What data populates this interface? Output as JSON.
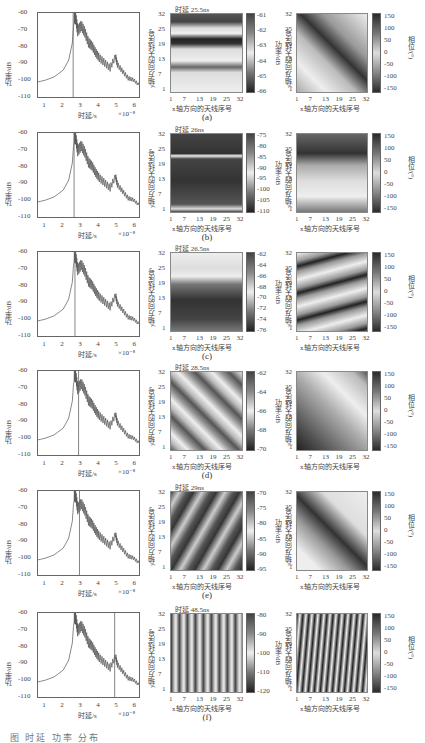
{
  "figure": {
    "caption_partial": "图  时延 功率 分布"
  },
  "common": {
    "left_ylabel": "功率/dB",
    "left_xlabel": "时延/s",
    "left_xmult": "×10⁻⁸",
    "left_yticks": [
      "-60",
      "-70",
      "-80",
      "-90",
      "-100",
      "-110"
    ],
    "left_xticks": [
      "1",
      "2",
      "3",
      "4",
      "5",
      "6"
    ],
    "heat_xlabel": "x轴方向的天线序号",
    "heat_ylabel": "y轴方向的天线序号",
    "heat_xticks": [
      "1",
      "7",
      "13",
      "19",
      "25",
      "32"
    ],
    "heat_yticks": [
      "32",
      "25",
      "19",
      "13",
      "7",
      "1"
    ],
    "power_cbar_label": "功率/dB",
    "phase_cbar_label": "相位/(°)",
    "phase_cbar_ticks": [
      "150",
      "100",
      "50",
      "0",
      "-50",
      "-100",
      "-150"
    ]
  },
  "rows": [
    {
      "label": "(a)",
      "title": "时延 25.5ns",
      "marker_delay_x10ns": 2.55,
      "power_cbar_ticks": [
        "-61",
        "-62",
        "-63",
        "-64",
        "-65",
        "-66"
      ]
    },
    {
      "label": "(b)",
      "title": "时延 26ns",
      "marker_delay_x10ns": 2.6,
      "power_cbar_ticks": [
        "-75",
        "-80",
        "-85",
        "-90",
        "-95",
        "-100",
        "-105",
        "-110"
      ]
    },
    {
      "label": "(c)",
      "title": "时延 26.5ns",
      "marker_delay_x10ns": 2.65,
      "power_cbar_ticks": [
        "-62",
        "-64",
        "-66",
        "-68",
        "-70",
        "-72",
        "-74",
        "-76"
      ]
    },
    {
      "label": "(d)",
      "title": "时延 28.5ns",
      "marker_delay_x10ns": 2.85,
      "power_cbar_ticks": [
        "-62",
        "-64",
        "-66",
        "-68",
        "-70"
      ]
    },
    {
      "label": "(e)",
      "title": "时延 29ns",
      "marker_delay_x10ns": 2.9,
      "power_cbar_ticks": [
        "-70",
        "-75",
        "-80",
        "-85",
        "-90",
        "-95"
      ]
    },
    {
      "label": "(f)",
      "title": "时延 48.5ns",
      "marker_delay_x10ns": 4.85,
      "power_cbar_ticks": [
        "-80",
        "-90",
        "-100",
        "-110",
        "-120"
      ]
    }
  ],
  "chart_data": [
    {
      "type": "line",
      "title": "Power delay profile (all rows share curve)",
      "xlabel": "时延/s",
      "ylabel": "功率/dB",
      "x_multiplier": "1e-8",
      "xlim": [
        0.6,
        6.2
      ],
      "ylim": [
        -110,
        -60
      ],
      "x": [
        0.6,
        1.0,
        1.5,
        2.0,
        2.3,
        2.5,
        2.6,
        2.7,
        2.8,
        3.0,
        3.2,
        3.4,
        3.6,
        3.8,
        4.0,
        4.3,
        4.6,
        4.9,
        5.0,
        5.3,
        5.6,
        5.9,
        6.2
      ],
      "values": [
        -101,
        -100,
        -98,
        -94,
        -88,
        -78,
        -63,
        -64,
        -71,
        -68,
        -72,
        -78,
        -80,
        -84,
        -87,
        -90,
        -93,
        -86,
        -91,
        -95,
        -99,
        -100,
        -103
      ],
      "vertical_markers_x": [
        2.55,
        2.6,
        2.65,
        2.85,
        2.9,
        4.85
      ]
    },
    {
      "type": "heatmap",
      "title": "Power maps per delay",
      "xlabel": "x轴方向的天线序号",
      "ylabel": "y轴方向的天线序号",
      "x_ticks": [
        1,
        7,
        13,
        19,
        25,
        32
      ],
      "y_ticks": [
        1,
        7,
        13,
        19,
        25,
        32
      ],
      "panels": [
        {
          "label": "(a)",
          "delay": "25.5ns",
          "clim": [
            -66,
            -60.5
          ]
        },
        {
          "label": "(b)",
          "delay": "26ns",
          "clim": [
            -112,
            -72
          ]
        },
        {
          "label": "(c)",
          "delay": "26.5ns",
          "clim": [
            -77,
            -61
          ]
        },
        {
          "label": "(d)",
          "delay": "28.5ns",
          "clim": [
            -71,
            -61
          ]
        },
        {
          "label": "(e)",
          "delay": "29ns",
          "clim": [
            -97,
            -68
          ]
        },
        {
          "label": "(f)",
          "delay": "48.5ns",
          "clim": [
            -125,
            -78
          ]
        }
      ]
    },
    {
      "type": "heatmap",
      "title": "Phase maps per delay",
      "xlabel": "x轴方向的天线序号",
      "ylabel": "y轴方向的天线序号",
      "colorbar_label": "相位/(°)",
      "clim": [
        -180,
        180
      ],
      "colorbar_ticks": [
        150,
        100,
        50,
        0,
        -50,
        -100,
        -150
      ]
    }
  ]
}
